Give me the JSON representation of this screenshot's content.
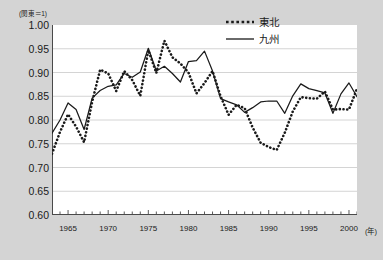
{
  "chart_data": {
    "type": "line",
    "title": "",
    "subtitle": "",
    "axis_note": "(関東＝1)",
    "xlabel": "(年)",
    "ylabel": "",
    "xlim": [
      1963,
      2001
    ],
    "ylim": [
      0.6,
      1.0
    ],
    "grid": true,
    "grid_axis": "y",
    "legend_position": "top-right",
    "ytick_labels": [
      "1.00",
      "0.95",
      "0.90",
      "0.85",
      "0.80",
      "0.75",
      "0.70",
      "0.65",
      "0.60"
    ],
    "ytick_values": [
      1.0,
      0.95,
      0.9,
      0.85,
      0.8,
      0.75,
      0.7,
      0.65,
      0.6
    ],
    "xtick_labels": [
      "1965",
      "1970",
      "1975",
      "1980",
      "1985",
      "1990",
      "1995",
      "2000"
    ],
    "xtick_values": [
      1965,
      1970,
      1975,
      1980,
      1985,
      1990,
      1995,
      2000
    ],
    "x": [
      1963,
      1964,
      1965,
      1966,
      1967,
      1968,
      1969,
      1970,
      1971,
      1972,
      1973,
      1974,
      1975,
      1976,
      1977,
      1978,
      1979,
      1980,
      1981,
      1982,
      1983,
      1984,
      1985,
      1986,
      1987,
      1988,
      1989,
      1990,
      1991,
      1992,
      1993,
      1994,
      1995,
      1996,
      1997,
      1998,
      1999,
      2000,
      2001
    ],
    "series": [
      {
        "name": "東北",
        "style": "dotted",
        "color": "#1a1a1a",
        "values": [
          0.729,
          0.775,
          0.812,
          0.786,
          0.753,
          0.838,
          0.906,
          0.898,
          0.861,
          0.903,
          0.884,
          0.851,
          0.947,
          0.899,
          0.967,
          0.932,
          0.919,
          0.9,
          0.856,
          0.878,
          0.903,
          0.85,
          0.811,
          0.832,
          0.825,
          0.784,
          0.752,
          0.743,
          0.737,
          0.773,
          0.818,
          0.848,
          0.846,
          0.845,
          0.86,
          0.822,
          0.823,
          0.822,
          0.866
        ]
      },
      {
        "name": "九州",
        "style": "solid",
        "color": "#1a1a1a",
        "values": [
          0.772,
          0.8,
          0.836,
          0.822,
          0.78,
          0.846,
          0.862,
          0.871,
          0.874,
          0.898,
          0.89,
          0.901,
          0.951,
          0.903,
          0.913,
          0.898,
          0.88,
          0.923,
          0.925,
          0.945,
          0.903,
          0.845,
          0.838,
          0.832,
          0.816,
          0.826,
          0.838,
          0.84,
          0.84,
          0.814,
          0.851,
          0.876,
          0.866,
          0.862,
          0.857,
          0.814,
          0.855,
          0.878,
          0.849
        ]
      }
    ]
  },
  "legend": {
    "items": [
      {
        "label": "東北"
      },
      {
        "label": "九州"
      }
    ]
  }
}
